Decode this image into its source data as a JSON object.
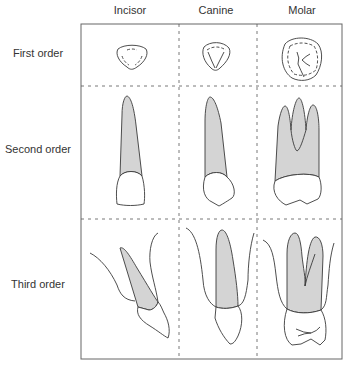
{
  "diagram": {
    "columns": [
      {
        "label": "Incisor"
      },
      {
        "label": "Canine"
      },
      {
        "label": "Molar"
      }
    ],
    "rows": [
      {
        "label": "First order"
      },
      {
        "label": "Second order"
      },
      {
        "label": "Third order"
      }
    ],
    "colors": {
      "line": "#3a3a3a",
      "root_fill": "#d4d4d4",
      "crown_fill": "#ffffff",
      "frame": "#666666"
    }
  }
}
